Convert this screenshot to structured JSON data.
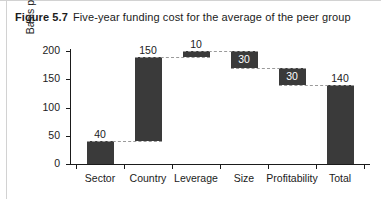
{
  "caption": {
    "figure_label": "Figure 5.7",
    "figure_text": "Five-year funding cost for the average of the peer group"
  },
  "chart_data": {
    "type": "bar",
    "subtype": "waterfall",
    "title": "Five-year funding cost for the average of the peer group",
    "xlabel": "",
    "ylabel": "Basis points",
    "ylim": [
      0,
      200
    ],
    "yticks": [
      0,
      50,
      100,
      150,
      200
    ],
    "ytick_labels": [
      "0",
      "50",
      "100",
      "150",
      "200"
    ],
    "grid": false,
    "legend": false,
    "categories": [
      "Sector",
      "Country",
      "Leverage",
      "Size",
      "Profitability",
      "Total"
    ],
    "values": [
      40,
      150,
      10,
      -30,
      -30,
      140
    ],
    "data_labels": [
      "40",
      "150",
      "10",
      "30",
      "30",
      "140"
    ],
    "bar_segments": [
      {
        "category": "Sector",
        "base": 0,
        "top": 40,
        "delta": 40,
        "label": "40",
        "label_position": "above",
        "kind": "start"
      },
      {
        "category": "Country",
        "base": 40,
        "top": 190,
        "delta": 150,
        "label": "150",
        "label_position": "above",
        "kind": "increase"
      },
      {
        "category": "Leverage",
        "base": 190,
        "top": 200,
        "delta": 10,
        "label": "10",
        "label_position": "above",
        "kind": "increase"
      },
      {
        "category": "Size",
        "base": 170,
        "top": 200,
        "delta": -30,
        "label": "30",
        "label_position": "inside",
        "kind": "decrease"
      },
      {
        "category": "Profitability",
        "base": 140,
        "top": 170,
        "delta": -30,
        "label": "30",
        "label_position": "inside",
        "kind": "decrease"
      },
      {
        "category": "Total",
        "base": 0,
        "top": 140,
        "delta": 140,
        "label": "140",
        "label_position": "above",
        "kind": "total"
      }
    ],
    "colors": {
      "bar": "#3a3a3a",
      "connector": "#9a9a9a",
      "axis": "#1b1b1b",
      "label_inside": "#ffffff",
      "background": "#ffffff"
    }
  }
}
